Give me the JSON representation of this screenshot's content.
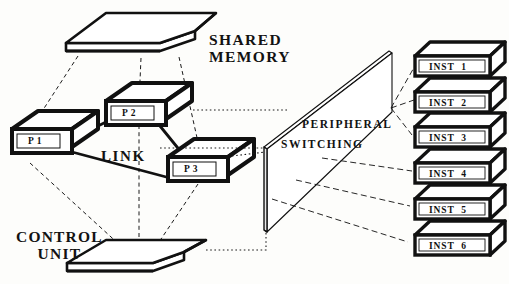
{
  "figure": {
    "background_color": "#fdfdfb",
    "ink_color": "#111111"
  },
  "labels": {
    "shared_memory_line1": "SHARED",
    "shared_memory_line2": "MEMORY",
    "control_unit_line1": "CONTROL",
    "control_unit_line2": "UNIT",
    "link": "LINK",
    "peripheral": "PERIPHERAL",
    "switching": "SWITCHING"
  },
  "processors": [
    {
      "id": "p1",
      "label": "P 1",
      "x": 12,
      "y": 129,
      "w": 60,
      "h": 24,
      "depth_x": 26,
      "depth_y": -18
    },
    {
      "id": "p2",
      "label": "P 2",
      "x": 106,
      "y": 101,
      "w": 60,
      "h": 24,
      "depth_x": 26,
      "depth_y": -18
    },
    {
      "id": "p3",
      "label": "P 3",
      "x": 168,
      "y": 157,
      "w": 60,
      "h": 24,
      "depth_x": 26,
      "depth_y": -18
    }
  ],
  "instruments": [
    {
      "id": "inst1",
      "label": "INST  1",
      "y": 56
    },
    {
      "id": "inst2",
      "label": "INST  2",
      "y": 92
    },
    {
      "id": "inst3",
      "label": "INST  3",
      "y": 127
    },
    {
      "id": "inst4",
      "label": "INST  4",
      "y": 163
    },
    {
      "id": "inst5",
      "label": "INST  5",
      "y": 199
    },
    {
      "id": "inst6",
      "label": "INST  6",
      "y": 235
    }
  ],
  "planes": {
    "shared_memory": {
      "name": "shared-memory-plate"
    },
    "control_unit": {
      "name": "control-unit-plate"
    },
    "switching": {
      "name": "peripheral-switching-plane"
    }
  },
  "connections": {
    "link_solid": [
      "P1-P2",
      "P1-P3",
      "P2-P3"
    ],
    "memory_dashed": [
      "SharedMemory-P1",
      "SharedMemory-P2",
      "SharedMemory-P3"
    ],
    "control_dashed": [
      "ControlUnit-P1",
      "ControlUnit-P2",
      "ControlUnit-P3"
    ],
    "switch_dotted": [
      "P2-SwitchPlane",
      "P3-SwitchPlane",
      "ControlUnit-SwitchPlane"
    ],
    "instrument_lines": [
      "Switch-INST1",
      "Switch-INST2",
      "Switch-INST3",
      "Switch-INST4",
      "Switch-INST5",
      "Switch-INST6"
    ]
  }
}
